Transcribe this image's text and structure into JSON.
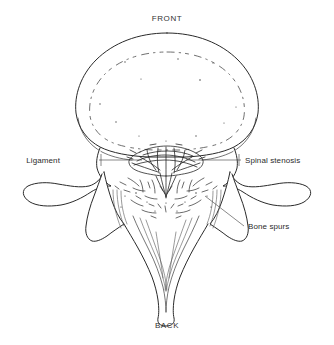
{
  "figure": {
    "background_color": "#ffffff",
    "line_color": "#2a2a2a",
    "text_color": "#2b2b2b"
  },
  "orientation_labels": {
    "top": "FRONT",
    "bottom": "BACK"
  },
  "annotations": [
    {
      "id": "ligament",
      "label": "Ligament",
      "side": "left",
      "text_x": 60,
      "text_y": 163,
      "leader_from_x": 99,
      "leader_from_y": 160,
      "leader_to_x": 142,
      "leader_to_y": 160
    },
    {
      "id": "spinal-stenosis",
      "label": "Spinal stenosis",
      "side": "right",
      "text_x": 245,
      "text_y": 163,
      "leader_from_x": 241,
      "leader_from_y": 160,
      "leader_to_x": 186,
      "leader_to_y": 160
    },
    {
      "id": "bone-spurs",
      "label": "Bone spurs",
      "side": "right",
      "text_x": 248,
      "text_y": 229,
      "leader_from_x": 244,
      "leader_from_y": 226,
      "leader_to_x": 205,
      "leader_to_y": 196
    }
  ],
  "anatomy_parts": [
    {
      "id": "vertebral-body",
      "name": "Vertebral body"
    },
    {
      "id": "vertebral-body-inner",
      "name": "Vertebral body inner margin"
    },
    {
      "id": "spinal-canal-stenosis",
      "name": "Narrowed spinal canal"
    },
    {
      "id": "thickened-ligament",
      "name": "Thickened ligamentum flavum"
    },
    {
      "id": "left-transverse-process",
      "name": "Left transverse process"
    },
    {
      "id": "right-transverse-process",
      "name": "Right transverse process"
    },
    {
      "id": "left-lamina",
      "name": "Left lamina"
    },
    {
      "id": "right-lamina",
      "name": "Right lamina"
    },
    {
      "id": "spinous-process",
      "name": "Spinous process"
    },
    {
      "id": "bone-spur-marks",
      "name": "Bone spur / osteophyte marks"
    }
  ]
}
